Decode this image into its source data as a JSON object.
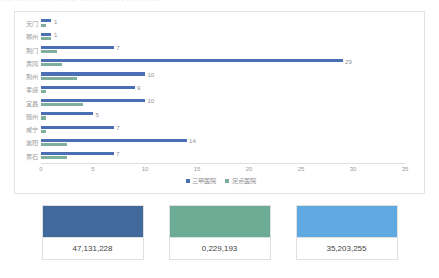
{
  "top_strip": {
    "ghost_text": "·  ··· ····  ··· ··· ····    ···· ···· ·· ········ ···  ·· ·····"
  },
  "chart_data": {
    "type": "bar",
    "orientation": "horizontal",
    "title": "",
    "xlabel": "",
    "ylabel": "",
    "xlim": [
      0,
      35
    ],
    "xticks": [
      "0",
      "5",
      "10",
      "15",
      "20",
      "25",
      "30",
      "35"
    ],
    "grid": false,
    "legend_position": "bottom-center",
    "categories": [
      "天门",
      "鄂州",
      "荆门",
      "黄冈",
      "荆州",
      "孝感",
      "宜昌",
      "随州",
      "咸宁",
      "襄阳",
      "黄石"
    ],
    "series": [
      {
        "name": "三甲医院",
        "color": "#4a6fb5",
        "values": [
          1,
          1,
          7,
          29,
          10,
          9,
          10,
          5,
          7,
          14,
          7
        ],
        "labels": [
          "1",
          "1",
          "7",
          "29",
          "10",
          "9",
          "10",
          "5",
          "7",
          "14",
          "7"
        ]
      },
      {
        "name": "定点医院",
        "color": "#7fae9e",
        "values": [
          0.5,
          1,
          1.5,
          2,
          3.5,
          0.5,
          4,
          0.5,
          0.5,
          2.5,
          2.5
        ],
        "labels": [
          "",
          "",
          "",
          "",
          "",
          "",
          "",
          "",
          "",
          "",
          ""
        ]
      }
    ]
  },
  "swatches": [
    {
      "name": "swatch-dark-blue",
      "color": "#41699c",
      "value": "47,131,228"
    },
    {
      "name": "swatch-green",
      "color": "#6cab94",
      "value": "0,229,193"
    },
    {
      "name": "swatch-light-blue",
      "color": "#5fa9e0",
      "value": "35,203,255"
    }
  ]
}
